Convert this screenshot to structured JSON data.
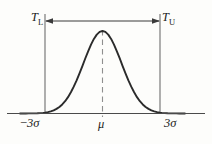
{
  "figure": {
    "kind": "normal-distribution-tolerance-diagram",
    "background_color": "#fdfdfb",
    "curve_color": "#2b2b2b",
    "tail_fill_color": "#c9c9c9",
    "axis_color": "#4a4a4a",
    "limit_line_color": "#6e6e6e",
    "mean_line_color": "#8a8a8a",
    "arrow_color": "#3a3a3a"
  },
  "labels": {
    "lower_tolerance": "T",
    "lower_tolerance_sub": "L",
    "upper_tolerance": "T",
    "upper_tolerance_sub": "U",
    "lower_sigma_sign": "−",
    "lower_sigma": "3σ",
    "mean": "μ",
    "upper_sigma": "3σ"
  },
  "chart_data": {
    "type": "area",
    "title": "",
    "subtitle": "",
    "xlabel": "",
    "ylabel": "",
    "grid": false,
    "legend_position": "none",
    "distribution": "normal",
    "mean": 0,
    "sigma": 1,
    "xlim": [
      -4.3,
      4.3
    ],
    "ylim": [
      0,
      1
    ],
    "tick_labels": [
      "−3σ",
      "μ",
      "3σ"
    ],
    "tick_values": [
      -3,
      0,
      3
    ],
    "annotations": [
      {
        "name": "lower_tolerance_limit",
        "text": "T_L",
        "x": -3,
        "type": "vertical-line-with-label"
      },
      {
        "name": "upper_tolerance_limit",
        "text": "T_U",
        "x": 3,
        "type": "vertical-line-with-label"
      },
      {
        "name": "mean_line",
        "text": "μ",
        "x": 0,
        "type": "dashed-vertical-line"
      },
      {
        "name": "tolerance_span_arrow",
        "text": "",
        "x_from": -3,
        "x_to": 3,
        "type": "double-headed-arrow"
      }
    ],
    "shaded_regions": [
      {
        "name": "lower_tail",
        "x_from": -4.3,
        "x_to": -3,
        "fill": "#c9c9c9"
      },
      {
        "name": "upper_tail",
        "x_from": 3,
        "x_to": 4.3,
        "fill": "#c9c9c9"
      }
    ],
    "x": [
      -4.3,
      -4.15,
      -4.0,
      -3.85,
      -3.7,
      -3.55,
      -3.4,
      -3.25,
      -3.1,
      -3.0,
      -2.85,
      -2.7,
      -2.55,
      -2.4,
      -2.25,
      -2.1,
      -1.95,
      -1.8,
      -1.65,
      -1.5,
      -1.35,
      -1.2,
      -1.05,
      -0.9,
      -0.75,
      -0.6,
      -0.45,
      -0.3,
      -0.15,
      0.0,
      0.15,
      0.3,
      0.45,
      0.6,
      0.75,
      0.9,
      1.05,
      1.2,
      1.35,
      1.5,
      1.65,
      1.8,
      1.95,
      2.1,
      2.25,
      2.4,
      2.55,
      2.7,
      2.85,
      3.0,
      3.1,
      3.25,
      3.4,
      3.55,
      3.7,
      3.85,
      4.0,
      4.15,
      4.3
    ],
    "y": [
      0.0,
      0.0,
      0.0,
      0.001,
      0.001,
      0.002,
      0.003,
      0.005,
      0.008,
      0.011,
      0.017,
      0.026,
      0.038,
      0.056,
      0.079,
      0.11,
      0.149,
      0.198,
      0.257,
      0.325,
      0.401,
      0.487,
      0.575,
      0.667,
      0.754,
      0.835,
      0.904,
      0.956,
      0.989,
      1.0,
      0.989,
      0.956,
      0.904,
      0.835,
      0.754,
      0.667,
      0.575,
      0.487,
      0.401,
      0.325,
      0.257,
      0.198,
      0.149,
      0.11,
      0.079,
      0.056,
      0.038,
      0.026,
      0.017,
      0.011,
      0.008,
      0.005,
      0.003,
      0.002,
      0.001,
      0.001,
      0.0,
      0.0,
      0.0
    ]
  }
}
